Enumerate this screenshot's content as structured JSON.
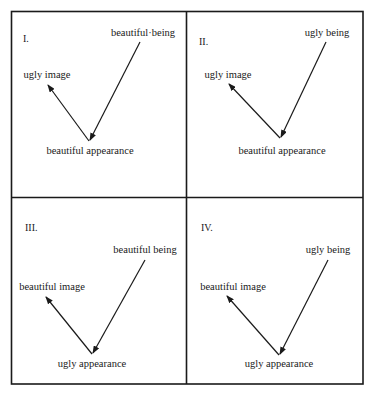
{
  "diagram": {
    "type": "four-panel arrow diagram",
    "border_color": "#1a1a1a",
    "panels": [
      {
        "numeral": "I.",
        "being_label": "beautiful·being",
        "image_label": "ugly image",
        "appearance_label": "beautiful appearance"
      },
      {
        "numeral": "II.",
        "being_label": "ugly being",
        "image_label": "ugly image",
        "appearance_label": "beautiful appearance"
      },
      {
        "numeral": "III.",
        "being_label": "beautiful being",
        "image_label": "beautiful image",
        "appearance_label": "ugly appearance"
      },
      {
        "numeral": "IV.",
        "being_label": "ugly being",
        "image_label": "beautiful image",
        "appearance_label": "ugly appearance"
      }
    ]
  }
}
